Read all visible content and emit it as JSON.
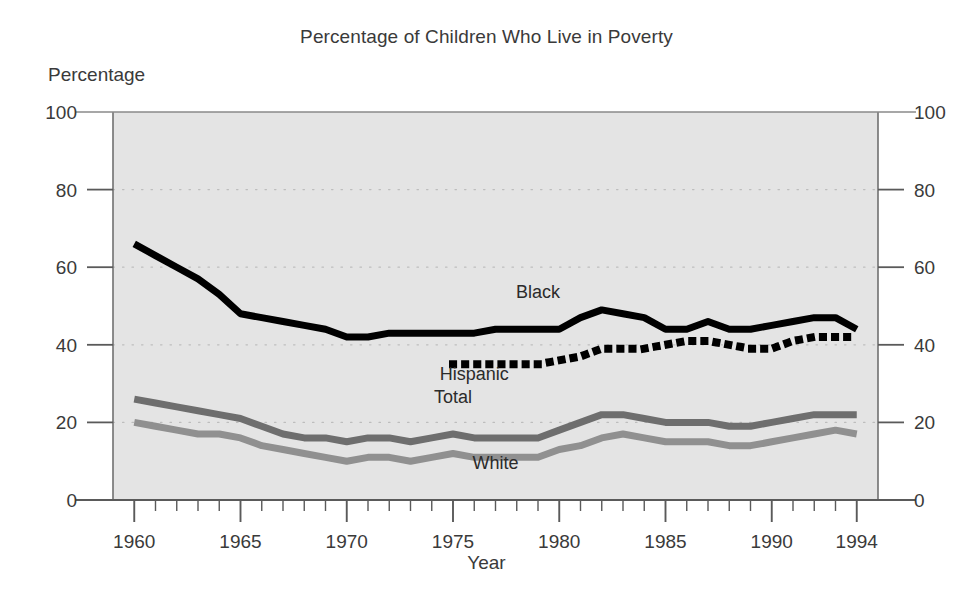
{
  "chart_data": {
    "type": "line",
    "title": "Percentage of Children Who Live in Poverty",
    "xlabel": "Year",
    "ylabel": "Percentage",
    "ylim": [
      0,
      100
    ],
    "xlim": [
      1959,
      1995
    ],
    "yticks": [
      0,
      20,
      40,
      60,
      80,
      100
    ],
    "yticks_right": [
      0,
      20,
      40,
      60,
      80,
      100
    ],
    "xticks": [
      1960,
      1965,
      1970,
      1975,
      1980,
      1985,
      1990,
      1994
    ],
    "xtick_minor_step": 1,
    "grid": "dotted-horizontal",
    "legend": "inline-labels",
    "plot_background": "#e4e4e4",
    "series": [
      {
        "name": "Black",
        "style": "solid-thick",
        "color": "#000000",
        "label_x": 1979,
        "label_y": 52,
        "x": [
          1960,
          1961,
          1962,
          1963,
          1964,
          1965,
          1966,
          1967,
          1968,
          1969,
          1970,
          1971,
          1972,
          1973,
          1974,
          1975,
          1976,
          1977,
          1978,
          1979,
          1980,
          1981,
          1982,
          1983,
          1984,
          1985,
          1986,
          1987,
          1988,
          1989,
          1990,
          1991,
          1992,
          1993,
          1994
        ],
        "values": [
          66,
          63,
          60,
          57,
          53,
          48,
          47,
          46,
          45,
          44,
          42,
          42,
          43,
          43,
          43,
          43,
          43,
          44,
          44,
          44,
          44,
          47,
          49,
          48,
          47,
          44,
          44,
          46,
          44,
          44,
          45,
          46,
          47,
          47,
          44
        ]
      },
      {
        "name": "Hispanic",
        "style": "dotted-thick",
        "color": "#000000",
        "label_x": 1976,
        "label_y": 31,
        "x": [
          1975,
          1976,
          1977,
          1978,
          1979,
          1980,
          1981,
          1982,
          1983,
          1984,
          1985,
          1986,
          1987,
          1988,
          1989,
          1990,
          1991,
          1992,
          1993,
          1994
        ],
        "values": [
          35,
          35,
          35,
          35,
          35,
          36,
          37,
          39,
          39,
          39,
          40,
          41,
          41,
          40,
          39,
          39,
          41,
          42,
          42,
          42
        ]
      },
      {
        "name": "Total",
        "style": "solid-thick",
        "color": "#6e6e6e",
        "label_x": 1975,
        "label_y": 25,
        "x": [
          1960,
          1961,
          1962,
          1963,
          1964,
          1965,
          1966,
          1967,
          1968,
          1969,
          1970,
          1971,
          1972,
          1973,
          1974,
          1975,
          1976,
          1977,
          1978,
          1979,
          1980,
          1981,
          1982,
          1983,
          1984,
          1985,
          1986,
          1987,
          1988,
          1989,
          1990,
          1991,
          1992,
          1993,
          1994
        ],
        "values": [
          26,
          25,
          24,
          23,
          22,
          21,
          19,
          17,
          16,
          16,
          15,
          16,
          16,
          15,
          16,
          17,
          16,
          16,
          16,
          16,
          18,
          20,
          22,
          22,
          21,
          20,
          20,
          20,
          19,
          19,
          20,
          21,
          22,
          22,
          22
        ]
      },
      {
        "name": "White",
        "style": "solid-thick",
        "color": "#909090",
        "label_x": 1977,
        "label_y": 8,
        "x": [
          1960,
          1961,
          1962,
          1963,
          1964,
          1965,
          1966,
          1967,
          1968,
          1969,
          1970,
          1971,
          1972,
          1973,
          1974,
          1975,
          1976,
          1977,
          1978,
          1979,
          1980,
          1981,
          1982,
          1983,
          1984,
          1985,
          1986,
          1987,
          1988,
          1989,
          1990,
          1991,
          1992,
          1993,
          1994
        ],
        "values": [
          20,
          19,
          18,
          17,
          17,
          16,
          14,
          13,
          12,
          11,
          10,
          11,
          11,
          10,
          11,
          12,
          11,
          11,
          11,
          11,
          13,
          14,
          16,
          17,
          16,
          15,
          15,
          15,
          14,
          14,
          15,
          16,
          17,
          18,
          17
        ]
      }
    ]
  }
}
